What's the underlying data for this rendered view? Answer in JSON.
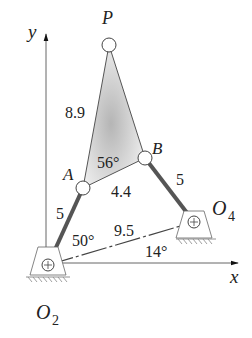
{
  "diagram": {
    "type": "four-bar linkage with coupler point",
    "axes": {
      "x_label": "x",
      "y_label": "y"
    },
    "points": {
      "P": {
        "label": "P"
      },
      "A": {
        "label": "A"
      },
      "B": {
        "label": "B"
      },
      "O2": {
        "label": "O",
        "sub": "2"
      },
      "O4": {
        "label": "O",
        "sub": "4"
      }
    },
    "dimensions": {
      "AP": "8.9",
      "AB": "4.4",
      "O2A": "5",
      "O4B": "5",
      "O2O4": "9.5"
    },
    "angles": {
      "coupler_angle": "56°",
      "crank_angle": "50°",
      "ground_angle": "14°"
    },
    "colors": {
      "link": "#555555",
      "coupler_fill_dark": "#b8b8b8",
      "coupler_fill_light": "#f2f2f2",
      "line": "#444444"
    }
  }
}
